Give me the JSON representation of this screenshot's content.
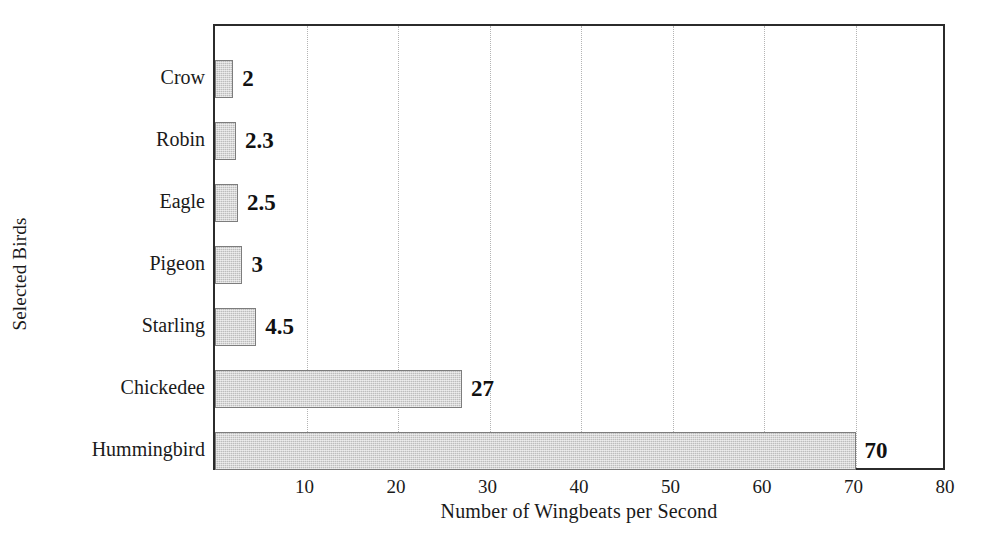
{
  "chart_data": {
    "type": "bar",
    "orientation": "horizontal",
    "title": "",
    "xlabel": "Number of Wingbeats per Second",
    "ylabel": "Selected Birds",
    "categories": [
      "Crow",
      "Robin",
      "Eagle",
      "Pigeon",
      "Starling",
      "Chickedee",
      "Hummingbird"
    ],
    "values": [
      2,
      2.3,
      2.5,
      3,
      4.5,
      27,
      70
    ],
    "value_labels": [
      "2",
      "2.3",
      "2.5",
      "3",
      "4.5",
      "27",
      "70"
    ],
    "xlim": [
      0,
      80
    ],
    "xticks": [
      10,
      20,
      30,
      40,
      50,
      60,
      70,
      80
    ],
    "xtick_labels": [
      "10",
      "20",
      "30",
      "40",
      "50",
      "60",
      "70",
      "80"
    ],
    "grid": "vertical-dotted",
    "legend": "none",
    "bar_fill_color": "#bdbdbd",
    "bar_border_color": "#7d7d7d",
    "axis_color": "#2b2b2b",
    "gridline_color": "#b4b4b4",
    "text_color": "#1a1a1a",
    "background_color": "#ffffff"
  }
}
